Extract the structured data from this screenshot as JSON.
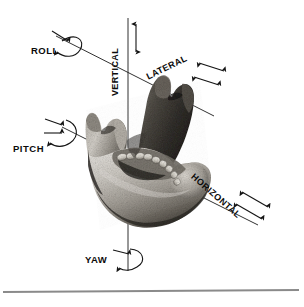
{
  "figure": {
    "background_color": "#ffffff",
    "line_color": "#1a1a1a",
    "rule_color": "#8a8a8a"
  },
  "specimen": {
    "name": "human-mandible-photograph",
    "description": "Grayscale photograph of a human mandible viewed obliquely",
    "tone_light": "#d8d5d0",
    "tone_mid": "#9b968f",
    "tone_dark": "#3a3733",
    "tone_shadow": "#1c1a18"
  },
  "axes": [
    {
      "id": "vertical",
      "label": "VERTICAL",
      "orientation": "vertical",
      "label_rotation": -90,
      "arrow_style": "double-headed",
      "label_x": 118,
      "label_y": 72
    },
    {
      "id": "lateral",
      "label": "LATERAL",
      "orientation": "oblique-up-right",
      "label_rotation": -26,
      "arrow_style": "double-headed",
      "label_x": 168,
      "label_y": 70
    },
    {
      "id": "horizontal",
      "label": "HORIZONTAL",
      "orientation": "oblique-down-right",
      "label_rotation": 41,
      "arrow_style": "double-headed",
      "label_x": 214,
      "label_y": 198
    }
  ],
  "rotations": [
    {
      "id": "roll",
      "label": "ROLL",
      "about_axis": "lateral",
      "label_x": 31,
      "label_y": 54
    },
    {
      "id": "pitch",
      "label": "PITCH",
      "about_axis": "horizontal",
      "label_x": 13,
      "label_y": 152
    },
    {
      "id": "yaw",
      "label": "YAW",
      "about_axis": "vertical",
      "label_x": 85,
      "label_y": 263
    }
  ],
  "origin": {
    "label": "axis-intersection",
    "x": 128,
    "y": 108
  }
}
